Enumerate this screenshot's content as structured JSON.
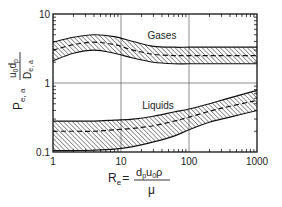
{
  "chart_data": {
    "type": "area",
    "title": "",
    "xscale": "log",
    "yscale": "log",
    "xlim": [
      1,
      1000
    ],
    "ylim": [
      0.1,
      10
    ],
    "grid": true,
    "legend": "none",
    "xlabel": {
      "symbol": "R",
      "subscript": "e",
      "equals": "=",
      "numerator": "dpu0ρ",
      "numerator_parts": [
        {
          "text": "d",
          "sub": "p"
        },
        {
          "text": "u",
          "sub": "0"
        },
        {
          "text": "ρ",
          "sub": ""
        }
      ],
      "denominator": "μ"
    },
    "ylabel": {
      "symbol": "P",
      "subscript": "e, a",
      "numerator_parts": [
        {
          "text": "u",
          "sub": "0"
        },
        {
          "text": "d",
          "sub": "p"
        }
      ],
      "denominator": {
        "text": "D",
        "sub": "e, a"
      }
    },
    "x_ticks": [
      1,
      10,
      100,
      1000
    ],
    "x_tick_labels": [
      "1",
      "10",
      "100",
      "1000"
    ],
    "y_ticks": [
      0.1,
      1,
      10
    ],
    "y_tick_labels": [
      "0.1",
      "1",
      "10"
    ],
    "x": [
      1,
      2,
      4,
      8,
      15,
      30,
      60,
      100,
      200,
      400,
      1000
    ],
    "series": [
      {
        "name": "Gases",
        "label": "Gases",
        "label_pos": {
          "x": 40,
          "y": 4.3
        },
        "upper": [
          3.9,
          4.6,
          5.0,
          4.7,
          4.0,
          3.4,
          3.3,
          3.3,
          3.3,
          3.3,
          3.3
        ],
        "center": [
          3.0,
          3.6,
          3.9,
          3.6,
          3.0,
          2.6,
          2.5,
          2.5,
          2.5,
          2.5,
          2.5
        ],
        "lower": [
          2.1,
          2.7,
          3.0,
          2.7,
          2.3,
          2.0,
          1.9,
          1.9,
          1.9,
          1.9,
          1.9
        ]
      },
      {
        "name": "Liquids",
        "label": "Liquids",
        "label_pos": {
          "x": 35,
          "y": 0.42
        },
        "upper": [
          0.28,
          0.28,
          0.28,
          0.29,
          0.3,
          0.33,
          0.38,
          0.42,
          0.5,
          0.61,
          0.78
        ],
        "center": [
          0.2,
          0.2,
          0.2,
          0.21,
          0.22,
          0.24,
          0.28,
          0.32,
          0.39,
          0.46,
          0.56
        ],
        "lower": [
          0.105,
          0.105,
          0.106,
          0.11,
          0.12,
          0.14,
          0.17,
          0.21,
          0.27,
          0.32,
          0.4
        ]
      }
    ]
  }
}
